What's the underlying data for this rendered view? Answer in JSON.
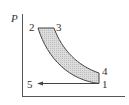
{
  "diagram": {
    "type": "P-v process diagram",
    "y_axis_label": "P",
    "x_axis_label": "",
    "points": [
      {
        "id": "1",
        "label": "1"
      },
      {
        "id": "2",
        "label": "2"
      },
      {
        "id": "3",
        "label": "3"
      },
      {
        "id": "4",
        "label": "4"
      },
      {
        "id": "5",
        "label": "5"
      }
    ],
    "colors": {
      "fill": "#d4d4d4",
      "line": "#444444",
      "axis": "#555555"
    }
  }
}
